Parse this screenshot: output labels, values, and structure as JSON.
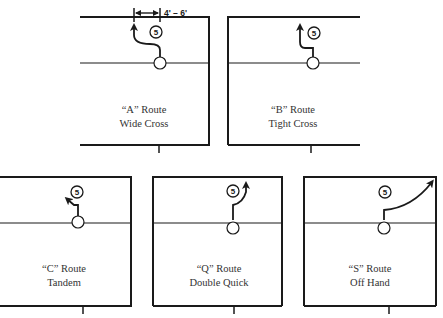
{
  "player_number": "5",
  "dimension_label": "4' – 6'",
  "routes": [
    {
      "id": "A",
      "name": "“A” Route",
      "description": "Wide Cross"
    },
    {
      "id": "B",
      "name": "“B” Route",
      "description": "Tight Cross"
    },
    {
      "id": "C",
      "name": "“C” Route",
      "description": "Tandem"
    },
    {
      "id": "Q",
      "name": "“Q” Route",
      "description": "Double Quick"
    },
    {
      "id": "S",
      "name": "“S” Route",
      "description": "Off Hand"
    }
  ],
  "colors": {
    "ink": "#1a1a1a",
    "paper": "#ffffff"
  }
}
